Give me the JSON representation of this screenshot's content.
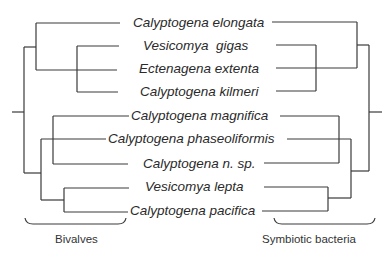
{
  "diagram": {
    "type": "tanglegram / cophylogeny",
    "taxa": [
      {
        "label": "Calyptogena elongata",
        "y": 23,
        "x": 133
      },
      {
        "label": "Vesicomya  gigas",
        "y": 46,
        "x": 143
      },
      {
        "label": "Ectenagena extenta",
        "y": 69,
        "x": 139
      },
      {
        "label": "Calyptogena kilmeri",
        "y": 92,
        "x": 140
      },
      {
        "label": "Calyptogena magnifica",
        "y": 116,
        "x": 131
      },
      {
        "label": "Calyptogena phaseoliformis",
        "y": 139,
        "x": 108
      },
      {
        "label": "Calyptogena n. sp.",
        "y": 164,
        "x": 143
      },
      {
        "label": "Vesicomya lepta",
        "y": 187,
        "x": 145
      },
      {
        "label": "Calyptogena pacifica",
        "y": 211,
        "x": 130
      }
    ],
    "groups": {
      "left": {
        "label": "Bivalves"
      },
      "right": {
        "label": "Symbiotic bacteria"
      }
    },
    "colors": {
      "line": "#3a3a3a",
      "text": "#2a2a2a",
      "background": "#ffffff"
    }
  }
}
